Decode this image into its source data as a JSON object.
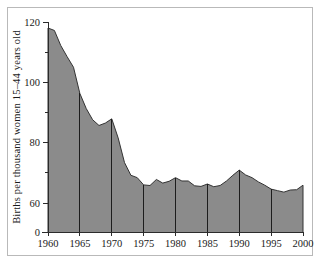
{
  "chart_data": {
    "type": "area",
    "title": "",
    "xlabel": "",
    "ylabel": "Births per thousand women 15–44 years old",
    "xlim": [
      1960,
      2000
    ],
    "ylim": [
      55,
      122
    ],
    "ybreak": true,
    "grid": false,
    "legend": null,
    "y_tick_labels": [
      "0",
      "60",
      "80",
      "100",
      "120"
    ],
    "y_tick_values": [
      0,
      60,
      80,
      100,
      120
    ],
    "y_minor_ticks": [
      70,
      90,
      110
    ],
    "x_tick_labels": [
      "1960",
      "1965",
      "1970",
      "1975",
      "1980",
      "1985",
      "1990",
      "1995",
      "2000"
    ],
    "x_tick_values": [
      1960,
      1965,
      1970,
      1975,
      1980,
      1985,
      1990,
      1995,
      2000
    ],
    "vertical_rules_at": [
      1965,
      1970,
      1975,
      1980,
      1985,
      1990,
      1995
    ],
    "x": [
      1960,
      1961,
      1962,
      1963,
      1964,
      1965,
      1966,
      1967,
      1968,
      1969,
      1970,
      1971,
      1972,
      1973,
      1974,
      1975,
      1976,
      1977,
      1978,
      1979,
      1980,
      1981,
      1982,
      1983,
      1984,
      1985,
      1986,
      1987,
      1988,
      1989,
      1990,
      1991,
      1992,
      1993,
      1994,
      1995,
      1996,
      1997,
      1998,
      1999,
      2000
    ],
    "values": [
      118.0,
      117.2,
      112.2,
      108.5,
      105.0,
      96.3,
      91.3,
      87.6,
      85.7,
      86.5,
      87.9,
      81.6,
      73.4,
      69.2,
      68.4,
      66.0,
      65.8,
      67.8,
      66.6,
      67.2,
      68.4,
      67.3,
      67.3,
      65.7,
      65.5,
      66.3,
      65.4,
      65.8,
      67.3,
      69.2,
      70.9,
      69.3,
      68.4,
      67.0,
      65.9,
      64.6,
      64.1,
      63.6,
      64.3,
      64.4,
      65.9
    ]
  }
}
